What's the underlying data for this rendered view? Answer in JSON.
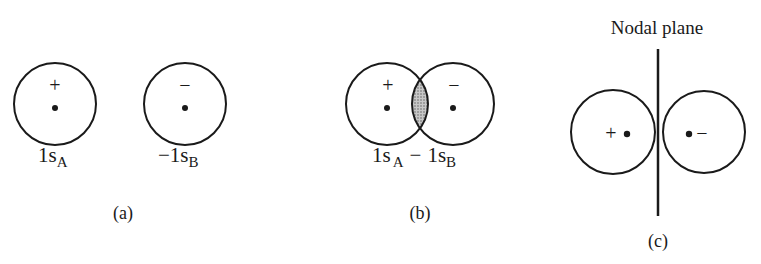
{
  "panels": [
    {
      "id": "a",
      "caption": "(a)",
      "orbitals": [
        {
          "sign": "+",
          "label_main": "1s",
          "label_sub": "A",
          "label_prefix": ""
        },
        {
          "sign": "−",
          "label_main": "1s",
          "label_sub": "B",
          "label_prefix": "−"
        }
      ]
    },
    {
      "id": "b",
      "caption": "(b)",
      "signs": [
        "+",
        "−"
      ],
      "label": {
        "part1_main": "1s",
        "part1_sub": "A",
        "op": "−",
        "part2_main": "1s",
        "part2_sub": "B"
      },
      "overlap_fill": "#b8b8b8"
    },
    {
      "id": "c",
      "caption": "(c)",
      "signs": [
        "+",
        "−"
      ],
      "nodal_plane_label": "Nodal plane"
    }
  ],
  "colors": {
    "stroke": "#1a1a1a",
    "background": "#ffffff",
    "overlap": "#b8b8b8"
  }
}
